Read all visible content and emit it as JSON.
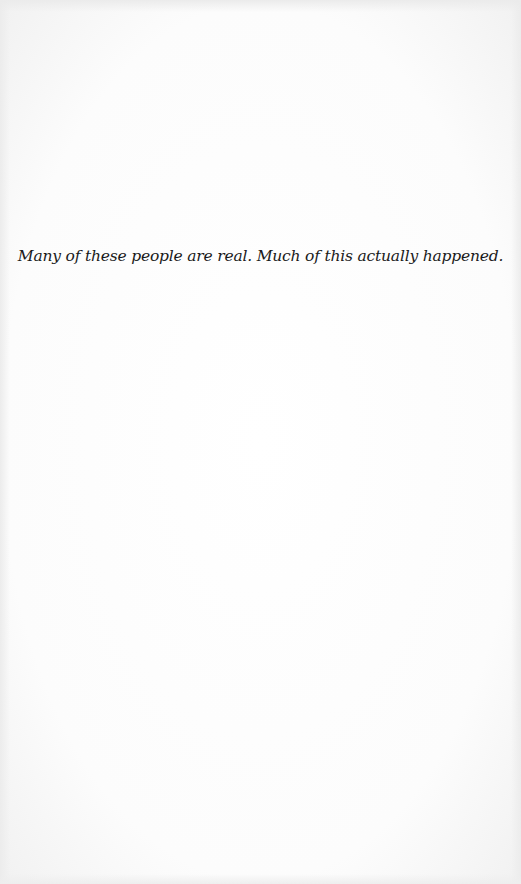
{
  "page": {
    "epigraph": "Many of these people are real. Much of this actually happened."
  },
  "colors": {
    "paper": "#fdfdfd",
    "text": "#1a1a1a"
  }
}
